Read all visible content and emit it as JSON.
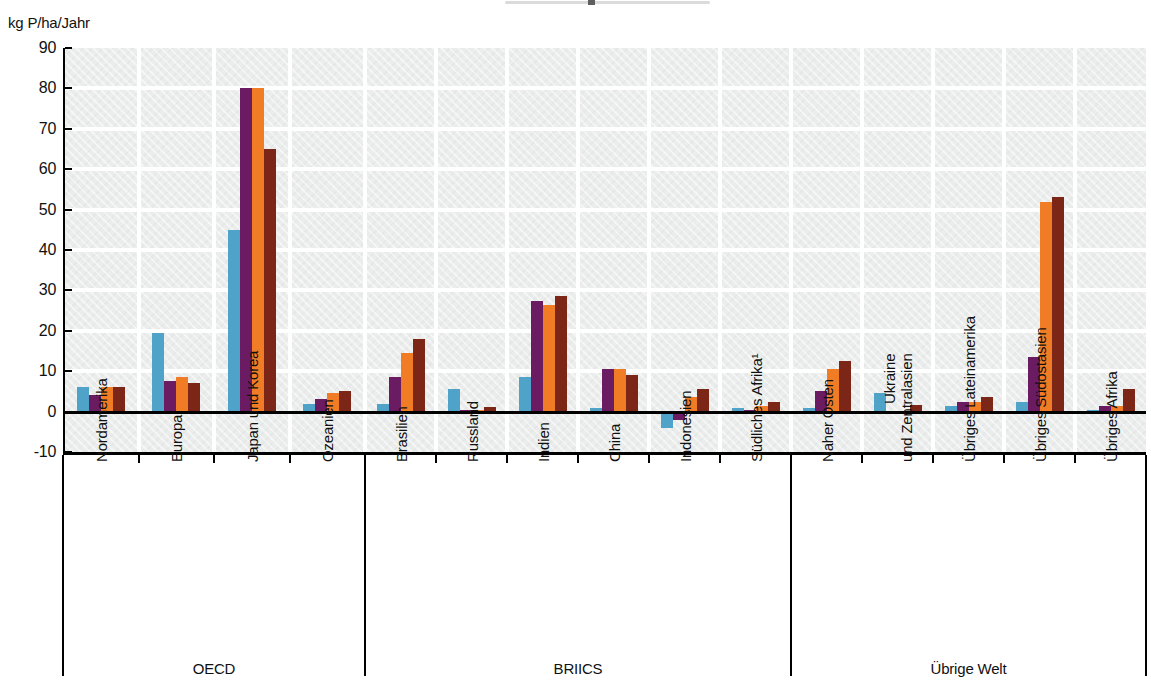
{
  "axis_title": "kg P/ha/Jahr",
  "chart_data": {
    "type": "bar",
    "title": "",
    "ylabel": "kg P/ha/Jahr",
    "xlabel": "",
    "ylim": [
      -10,
      90
    ],
    "ytick_step": 10,
    "grid": true,
    "legend_position": "cropped-out-of-view",
    "plot_background": "#ebedec",
    "gridline_color": "#ffffff",
    "sections": [
      "OECD",
      "BRIICS",
      "Übrige Welt"
    ],
    "series_colors": [
      "#4FA3C8",
      "#6B1B61",
      "#F07C25",
      "#7B2616"
    ],
    "series_color_names": [
      "blue",
      "purple",
      "orange",
      "dark-red"
    ],
    "categories": [
      {
        "label": "Nordamerika",
        "section": "OECD",
        "values": [
          6,
          4,
          6,
          6
        ]
      },
      {
        "label": "Europa",
        "section": "OECD",
        "values": [
          19.5,
          7.5,
          8.5,
          7
        ]
      },
      {
        "label": "Japan und Korea",
        "section": "OECD",
        "values": [
          45,
          80,
          80,
          65
        ]
      },
      {
        "label": "Ozeanien",
        "section": "OECD",
        "values": [
          2,
          3,
          4.5,
          5
        ]
      },
      {
        "label": "Brasilien",
        "section": "BRIICS",
        "values": [
          2,
          8.5,
          14.5,
          18
        ]
      },
      {
        "label": "Russland",
        "section": "BRIICS",
        "values": [
          5.7,
          0.3,
          0.3,
          1.2
        ]
      },
      {
        "label": "Indien",
        "section": "BRIICS",
        "values": [
          8.5,
          27.5,
          26.5,
          28.5
        ]
      },
      {
        "label": "China",
        "section": "BRIICS",
        "values": [
          1,
          10.5,
          10.5,
          9
        ]
      },
      {
        "label": "Indonesien",
        "section": "BRIICS",
        "values": [
          -4,
          -2,
          3.5,
          5.5
        ]
      },
      {
        "label": "Südliches Afrika¹",
        "section": "BRIICS",
        "values": [
          1,
          0.4,
          1.5,
          2.3
        ]
      },
      {
        "label": "Naher Osten",
        "section": "Übrige Welt",
        "values": [
          1,
          5,
          10.5,
          12.5
        ]
      },
      {
        "label": "Ukraine\nund Zentralasien",
        "section": "Übrige Welt",
        "values": [
          4.5,
          0.2,
          0.2,
          1.6
        ]
      },
      {
        "label": "Übriges Lateinamerika",
        "section": "Übrige Welt",
        "values": [
          1.5,
          2.5,
          2.5,
          3.5
        ]
      },
      {
        "label": "Übriges Südostasien",
        "section": "Übrige Welt",
        "values": [
          2.5,
          13.5,
          52,
          53
        ]
      },
      {
        "label": "Übriges Afrika",
        "section": "Übrige Welt",
        "values": [
          0.5,
          1.5,
          1.5,
          5.5
        ]
      }
    ]
  }
}
